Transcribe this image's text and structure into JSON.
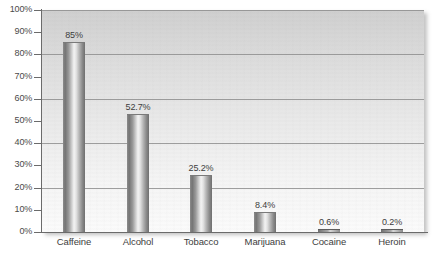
{
  "chart_data": {
    "type": "bar",
    "title": "",
    "subtitle": "",
    "xlabel": "",
    "ylabel": "",
    "categories": [
      "Caffeine",
      "Alcohol",
      "Tobacco",
      "Marijuana",
      "Cocaine",
      "Heroin"
    ],
    "values": [
      85,
      52.7,
      25.2,
      8.4,
      0.6,
      0.2
    ],
    "value_labels": [
      "85%",
      "52.7%",
      "25.2%",
      "8.4%",
      "0.6%",
      "0.2%"
    ],
    "ylim": [
      0,
      100
    ],
    "y_tick_labels": [
      "100%",
      "90%",
      "80%",
      "70%",
      "60%",
      "50%",
      "40%",
      "30%",
      "20%",
      "10%",
      "0%"
    ],
    "y_tick_values": [
      100,
      90,
      80,
      70,
      60,
      50,
      40,
      30,
      20,
      10,
      0
    ],
    "gridline_values": [
      100,
      80,
      60,
      40,
      20
    ],
    "grid": true,
    "legend": false,
    "legend_position": "none",
    "bar_style": "cylinder-gradient",
    "colors": {
      "bar_light": "#f3f3f3",
      "bar_dark": "#6f6f6f",
      "plot_background_top": "#cfcfcf",
      "plot_background_bottom": "#fbfbfb",
      "gridline": "#8e8e8e",
      "axis": "#6b6b6b",
      "text": "#3d3d3d"
    }
  }
}
